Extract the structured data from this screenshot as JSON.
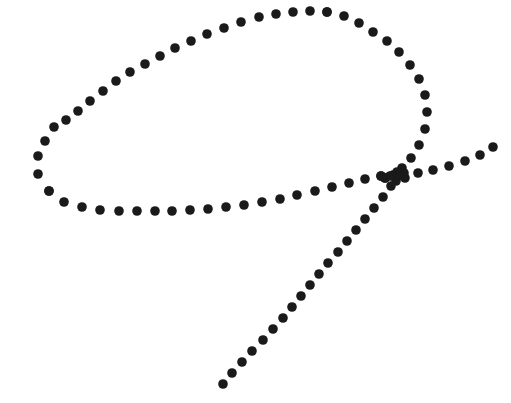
{
  "canvas": {
    "width": 511,
    "height": 403,
    "background_color": "#ffffff",
    "title": "Dotted freehand sketch"
  },
  "style": {
    "dot_color": "#1a1a1a",
    "dot_radius": 4.8,
    "dot_shape": "circle"
  },
  "chart_data": {
    "type": "scatter",
    "subtitle": "",
    "xlabel": "",
    "ylabel": "",
    "xlim": [
      0,
      511
    ],
    "ylim": [
      0,
      403
    ],
    "grid": false,
    "legend": "none",
    "annotations": [],
    "series": [
      {
        "name": "loop-outer-stroke",
        "color": "#1a1a1a",
        "marker": "circle",
        "marker_size": 9.6,
        "points": [
          [
            327,
            12
          ],
          [
            310,
            11
          ],
          [
            293,
            12
          ],
          [
            276,
            14
          ],
          [
            259,
            17
          ],
          [
            241,
            22
          ],
          [
            224,
            28
          ],
          [
            207,
            34
          ],
          [
            191,
            41
          ],
          [
            175,
            48
          ],
          [
            160,
            56
          ],
          [
            145,
            64
          ],
          [
            130,
            72
          ],
          [
            116,
            81
          ],
          [
            103,
            91
          ],
          [
            90,
            101
          ],
          [
            78,
            111
          ],
          [
            66,
            120
          ],
          [
            54,
            127
          ],
          [
            45,
            141
          ],
          [
            38,
            156
          ],
          [
            38,
            174
          ],
          [
            49,
            191
          ]
        ]
      },
      {
        "name": "loop-bottom-stroke",
        "color": "#1a1a1a",
        "marker": "circle",
        "marker_size": 9.6,
        "points": [
          [
            49,
            191
          ],
          [
            64,
            202
          ],
          [
            82,
            207
          ],
          [
            100,
            210
          ],
          [
            119,
            211
          ],
          [
            137,
            211
          ],
          [
            155,
            211
          ],
          [
            172,
            211
          ],
          [
            190,
            210
          ],
          [
            208,
            209
          ],
          [
            226,
            207
          ],
          [
            244,
            205
          ],
          [
            262,
            202
          ],
          [
            280,
            199
          ],
          [
            297,
            195
          ],
          [
            315,
            191
          ],
          [
            332,
            187
          ],
          [
            349,
            183
          ],
          [
            365,
            179
          ],
          [
            381,
            176
          ]
        ]
      },
      {
        "name": "loop-right-stroke",
        "color": "#1a1a1a",
        "marker": "circle",
        "marker_size": 9.6,
        "points": [
          [
            327,
            12
          ],
          [
            344,
            16
          ],
          [
            359,
            23
          ],
          [
            373,
            32
          ],
          [
            387,
            41
          ],
          [
            399,
            52
          ],
          [
            410,
            65
          ],
          [
            419,
            79
          ],
          [
            425,
            95
          ],
          [
            427,
            112
          ],
          [
            425,
            129
          ],
          [
            419,
            145
          ],
          [
            411,
            158
          ],
          [
            402,
            168
          ],
          [
            393,
            175
          ],
          [
            385,
            178
          ],
          [
            381,
            176
          ]
        ]
      },
      {
        "name": "hook-loop-stroke",
        "color": "#1a1a1a",
        "marker": "circle",
        "marker_size": 9.6,
        "points": [
          [
            385,
            178
          ],
          [
            396,
            181
          ],
          [
            405,
            178
          ],
          [
            404,
            173
          ],
          [
            397,
            172
          ],
          [
            390,
            176
          ]
        ]
      },
      {
        "name": "tail-descending-stroke",
        "color": "#1a1a1a",
        "marker": "circle",
        "marker_size": 9.6,
        "points": [
          [
            399,
            175
          ],
          [
            391,
            186
          ],
          [
            383,
            197
          ],
          [
            374,
            208
          ],
          [
            365,
            219
          ],
          [
            356,
            230
          ],
          [
            347,
            241
          ],
          [
            338,
            252
          ],
          [
            328,
            263
          ],
          [
            319,
            274
          ],
          [
            310,
            285
          ],
          [
            301,
            296
          ],
          [
            292,
            307
          ],
          [
            283,
            318
          ],
          [
            273,
            329
          ],
          [
            263,
            340
          ],
          [
            252,
            351
          ],
          [
            242,
            362
          ],
          [
            232,
            373
          ],
          [
            223,
            384
          ]
        ]
      },
      {
        "name": "upper-right-branch-stroke",
        "color": "#1a1a1a",
        "marker": "circle",
        "marker_size": 9.6,
        "points": [
          [
            403,
            176
          ],
          [
            418,
            173
          ],
          [
            433,
            170
          ],
          [
            449,
            166
          ],
          [
            465,
            161
          ],
          [
            480,
            155
          ],
          [
            493,
            147
          ]
        ]
      }
    ]
  }
}
